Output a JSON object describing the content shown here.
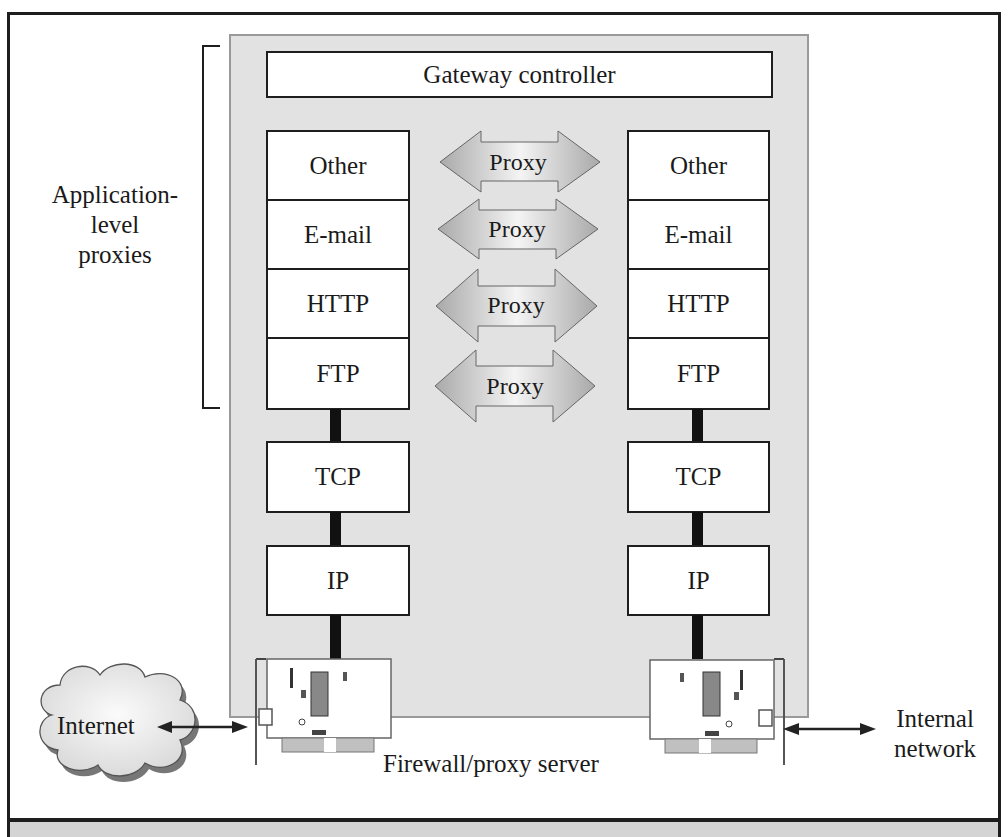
{
  "diagram": {
    "gateway_controller": "Gateway controller",
    "bracket_label": [
      "Application-",
      "level",
      "proxies"
    ],
    "left_stack": {
      "application_layers": [
        "Other",
        "E-mail",
        "HTTP",
        "FTP"
      ],
      "transport": "TCP",
      "network": "IP"
    },
    "right_stack": {
      "application_layers": [
        "Other",
        "E-mail",
        "HTTP",
        "FTP"
      ],
      "transport": "TCP",
      "network": "IP"
    },
    "proxies": [
      "Proxy",
      "Proxy",
      "Proxy",
      "Proxy"
    ],
    "internet_label": "Internet",
    "internal_network_label": [
      "Internal",
      "network"
    ],
    "server_label": "Firewall/proxy server",
    "colors": {
      "panel": "#e2e2e2",
      "proxy_arrow": "#bdbdbd",
      "line": "#1e1e1e",
      "cloud": "#eeeeee"
    }
  }
}
